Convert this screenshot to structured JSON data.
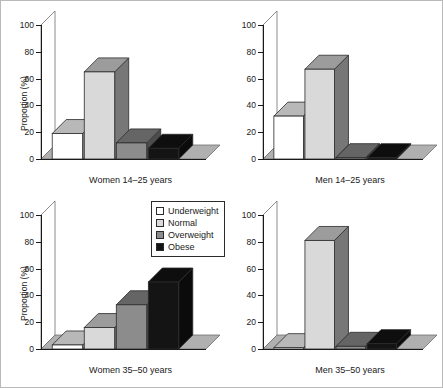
{
  "figure": {
    "ylabel": "Proportion (%)",
    "yticks": [
      "0",
      "20",
      "40",
      "60",
      "80",
      "100"
    ],
    "ylim": [
      0,
      100
    ]
  },
  "legend": {
    "title": "",
    "items": [
      {
        "label": "Underweight",
        "color": "#ffffff"
      },
      {
        "label": "Normal",
        "color": "#d9d9d9"
      },
      {
        "label": "Overweight",
        "color": "#8c8c8c"
      },
      {
        "label": "Obese",
        "color": "#141414"
      }
    ]
  },
  "colors": {
    "underweight": "#ffffff",
    "normal": "#d9d9d9",
    "overweight": "#8c8c8c",
    "obese": "#141414",
    "axis": "#1a1a1a",
    "floor": "#b0b0b0",
    "border": "#b9b9b9"
  },
  "chart_data": {
    "type": "bar",
    "title": "",
    "xlabel": "",
    "ylabel": "Proportion (%)",
    "ylim": [
      0,
      100
    ],
    "yticks": [
      0,
      20,
      40,
      60,
      80,
      100
    ],
    "grid": false,
    "legend_position": "center",
    "categories": [
      "Underweight",
      "Normal",
      "Overweight",
      "Obese"
    ],
    "panels": [
      {
        "name": "Women 14-25 years",
        "label": "Women 14–25 years",
        "values": [
          19,
          65,
          12,
          8
        ]
      },
      {
        "name": "Men 14-25 years",
        "label": "Men 14–25 years",
        "values": [
          32,
          67,
          1,
          1
        ]
      },
      {
        "name": "Women 35-50 years",
        "label": "Women 35–50 years",
        "values": [
          3,
          16,
          33,
          50
        ]
      },
      {
        "name": "Men 35-50 years",
        "label": "Men 35–50 years",
        "values": [
          1,
          81,
          2,
          4
        ]
      }
    ]
  }
}
